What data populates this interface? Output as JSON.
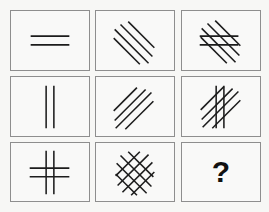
{
  "puzzle": {
    "type": "3x3 visual matrix reasoning",
    "grid": {
      "rows": 3,
      "columns": 3
    },
    "cells": [
      {
        "row": 1,
        "col": 1,
        "description": "two parallel horizontal lines"
      },
      {
        "row": 1,
        "col": 2,
        "description": "four parallel diagonal lines slanting down-right"
      },
      {
        "row": 1,
        "col": 3,
        "description": "four down-right diagonal lines overlaid with two horizontal lines"
      },
      {
        "row": 2,
        "col": 1,
        "description": "two parallel vertical lines"
      },
      {
        "row": 2,
        "col": 2,
        "description": "four parallel diagonal lines slanting up-right"
      },
      {
        "row": 2,
        "col": 3,
        "description": "four up-right diagonal lines overlaid with two vertical lines"
      },
      {
        "row": 3,
        "col": 1,
        "description": "two horizontal and two vertical lines forming a hash grid"
      },
      {
        "row": 3,
        "col": 2,
        "description": "crosshatch of down-right and up-right diagonal lines"
      },
      {
        "row": 3,
        "col": 3,
        "description": "unknown answer cell",
        "label": "?"
      }
    ],
    "answer_placeholder": "?",
    "colors": {
      "line": "#1c1c1c",
      "border": "#8e8e8e",
      "background": "#f7f7f5",
      "question_mark": "#111111"
    }
  }
}
